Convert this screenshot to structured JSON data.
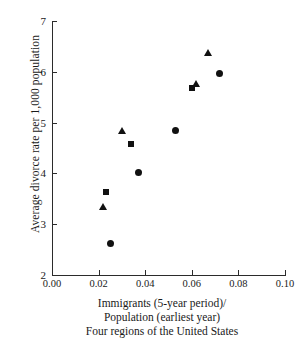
{
  "chart_data": {
    "type": "scatter",
    "title": "",
    "xlabel": "Immigrants (5-year period)/ Population (earliest year)",
    "ylabel": "Average divorce rate per 1,000 population",
    "xlim": [
      0.0,
      0.1
    ],
    "ylim": [
      2,
      7
    ],
    "xticks": [
      "0.00",
      "0.02",
      "0.04",
      "0.06",
      "0.08",
      "0.10"
    ],
    "xtick_values": [
      0.0,
      0.02,
      0.04,
      0.06,
      0.08,
      0.1
    ],
    "yticks": [
      "7",
      "6",
      "5",
      "4",
      "3",
      "2"
    ],
    "ytick_values": [
      7,
      6,
      5,
      4,
      3,
      2
    ],
    "grid": false,
    "legend": "none",
    "points": [
      {
        "x": 0.022,
        "y": 3.35,
        "marker": "triangle"
      },
      {
        "x": 0.023,
        "y": 3.64,
        "marker": "square"
      },
      {
        "x": 0.025,
        "y": 2.62,
        "marker": "circle"
      },
      {
        "x": 0.03,
        "y": 4.85,
        "marker": "triangle"
      },
      {
        "x": 0.034,
        "y": 4.58,
        "marker": "square"
      },
      {
        "x": 0.037,
        "y": 4.01,
        "marker": "circle"
      },
      {
        "x": 0.053,
        "y": 4.85,
        "marker": "circle"
      },
      {
        "x": 0.06,
        "y": 5.68,
        "marker": "square"
      },
      {
        "x": 0.062,
        "y": 5.77,
        "marker": "triangle"
      },
      {
        "x": 0.067,
        "y": 6.37,
        "marker": "triangle"
      },
      {
        "x": 0.072,
        "y": 5.97,
        "marker": "circle"
      }
    ],
    "marker_color": "#111111"
  },
  "caption": {
    "line1": "Immigrants (5-year period)/",
    "line2": "Population (earliest year)",
    "line3": "Four regions of the United States"
  },
  "axis": {
    "y_title": "Average divorce rate per 1,000 population"
  }
}
